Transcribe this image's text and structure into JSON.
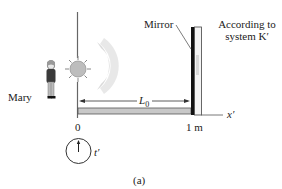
{
  "figure": {
    "caption": "(a)",
    "observer_label": "Mary",
    "mirror_label": "Mirror",
    "frame_label_line1": "According to",
    "frame_label_line2": "system K′",
    "distance_label": "L",
    "distance_subscript": "0",
    "axis_label": "x′",
    "origin_tick": "0",
    "end_tick": "1 m",
    "clock_label": "t′",
    "icons": [
      "person-icon",
      "light-source-icon",
      "wavefront-icon",
      "mirror-icon",
      "clock-icon"
    ]
  },
  "colors": {
    "line": "#555555",
    "bar_fill": "#c8c8c8",
    "mirror_dark": "#111111",
    "sun_fill": "#bdbdbd",
    "wave": "#cfcfcf"
  }
}
